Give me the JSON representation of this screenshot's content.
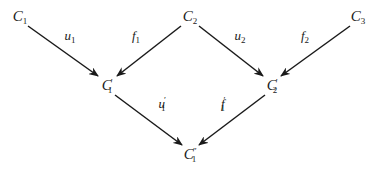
{
  "diagram": {
    "type": "commutative-diagram",
    "nodes": [
      {
        "id": "C1",
        "base": "C",
        "sub": "1",
        "sup": "",
        "x": 20,
        "y": 17
      },
      {
        "id": "C2",
        "base": "C",
        "sub": "2",
        "sup": "",
        "x": 190,
        "y": 17
      },
      {
        "id": "C3",
        "base": "C",
        "sub": "3",
        "sup": "",
        "x": 358,
        "y": 17
      },
      {
        "id": "C1p",
        "base": "C",
        "sub": "1",
        "sup": "′",
        "x": 107,
        "y": 86
      },
      {
        "id": "C2p",
        "base": "C",
        "sub": "2",
        "sup": "′",
        "x": 272,
        "y": 86
      },
      {
        "id": "C1pp",
        "base": "C",
        "sub": "1",
        "sup": "″",
        "x": 190,
        "y": 155
      }
    ],
    "edges": [
      {
        "from": "C1",
        "to": "C1p",
        "label_base": "u",
        "label_sub": "1",
        "label_sup": "",
        "x1": 28,
        "y1": 26,
        "x2": 98,
        "y2": 76,
        "lx": 70,
        "ly": 37
      },
      {
        "from": "C2",
        "to": "C1p",
        "label_base": "f",
        "label_sub": "1",
        "label_sup": "",
        "x1": 181,
        "y1": 26,
        "x2": 117,
        "y2": 76,
        "lx": 136,
        "ly": 37
      },
      {
        "from": "C2",
        "to": "C2p",
        "label_base": "u",
        "label_sub": "2",
        "label_sup": "",
        "x1": 199,
        "y1": 26,
        "x2": 263,
        "y2": 76,
        "lx": 240,
        "ly": 37
      },
      {
        "from": "C3",
        "to": "C2p",
        "label_base": "f",
        "label_sub": "2",
        "label_sup": "",
        "x1": 350,
        "y1": 26,
        "x2": 281,
        "y2": 76,
        "lx": 305,
        "ly": 37
      },
      {
        "from": "C1p",
        "to": "C1pp",
        "label_base": "u",
        "label_sub": "1",
        "label_sup": "′",
        "x1": 115,
        "y1": 95,
        "x2": 182,
        "y2": 145,
        "lx": 162,
        "ly": 104
      },
      {
        "from": "C2p",
        "to": "C1pp",
        "label_base": "f",
        "label_sub": "1",
        "label_sup": "′",
        "x1": 265,
        "y1": 95,
        "x2": 199,
        "y2": 145,
        "lx": 223,
        "ly": 104
      }
    ],
    "colors": {
      "ink": "#1a1a1a",
      "background": "#ffffff"
    }
  }
}
